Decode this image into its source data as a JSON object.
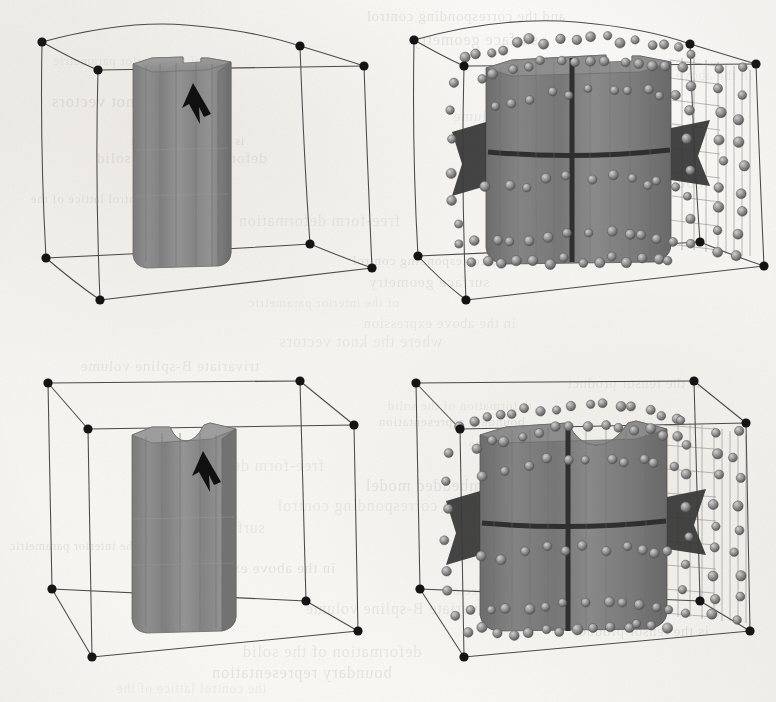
{
  "figure": {
    "domain_note": "scanned monochrome halftone figure from a geometric-modelling paper",
    "panel_count": 4,
    "grid": "2 rows x 2 columns",
    "background_color": "#f8f7f5",
    "ink_color": "#111111",
    "solid_fill_color": "#8a8a8a",
    "solid_shade_dark": "#6f6f6f",
    "solid_shade_light": "#9c9c9c",
    "seam_color": "#3a3a3a",
    "wire_color": "#5a5a5a",
    "sphere_color": "#8d8d8d",
    "box_line_color": "#4a4a4a"
  },
  "panels": [
    {
      "id": "top-left",
      "name": "deformed-solid-shaded",
      "row": 1,
      "column": 1,
      "box_style": "curved",
      "box_description": "warped trivariate bounding box with arced edges and 8 solid black corner nodes",
      "corner_node_count": 8,
      "content": "shaded gray rounded-square prism with a narrow rectangular step notch in the top face",
      "notch_style": "narrow-step",
      "has_arrow": true,
      "arrow_direction": "up-left",
      "arrow_target": "top-face notch",
      "has_control_points": false
    },
    {
      "id": "top-right",
      "name": "deformed-solid-control-lattice",
      "row": 1,
      "column": 2,
      "box_style": "curved",
      "box_description": "warped trivariate bounding box with arced edges and 8 solid black corner nodes",
      "corner_node_count": 8,
      "content": "same solid overlaid with its control lattice: shaded control spheres, thin mesh wires, dark patch-boundary seams and a dark left flange",
      "notch_style": "narrow-step",
      "has_arrow": false,
      "has_control_points": true,
      "control_point_count": 104,
      "seams": [
        "vertical mid seam",
        "horizontal mid seam"
      ],
      "seam_layout": "cross dividing surface into four patches"
    },
    {
      "id": "bottom-left",
      "name": "undeformed-solid-shaded",
      "row": 2,
      "column": 1,
      "box_style": "straight",
      "box_description": "straight-edged parallelepiped bounding box with 8 solid black corner nodes",
      "corner_node_count": 8,
      "content": "shaded gray rounded-square prism with a wide rounded U-shaped notch in the top face",
      "notch_style": "wide-round",
      "has_arrow": true,
      "arrow_direction": "up-left",
      "arrow_target": "top-face notch",
      "has_control_points": false
    },
    {
      "id": "bottom-right",
      "name": "undeformed-solid-control-lattice",
      "row": 2,
      "column": 2,
      "box_style": "straight",
      "box_description": "straight-edged parallelepiped bounding box with 8 solid black corner nodes",
      "corner_node_count": 8,
      "content": "same solid overlaid with its control lattice: shaded control spheres, thin mesh wires, dark patch-boundary seams and a dark left flange",
      "notch_style": "wide-round",
      "has_arrow": false,
      "has_control_points": true,
      "control_point_count": 104,
      "seams": [
        "vertical mid seam",
        "horizontal mid seam"
      ],
      "seam_layout": "cross dividing surface into four patches"
    }
  ],
  "bleed_through_text": {
    "legible": false,
    "description": "faint mirrored text showing through from the reverse side of the printed page",
    "lines": [
      "and the corresponding control",
      "surface geometry",
      "of the interior parametric",
      "in the above expression",
      "where the knot vectors",
      "trivariate B-spline volume",
      "is the tensor product",
      "deformation of the solid",
      "boundary representation",
      "the control lattice of the",
      "free-form deformation",
      "of the embedded model"
    ]
  }
}
